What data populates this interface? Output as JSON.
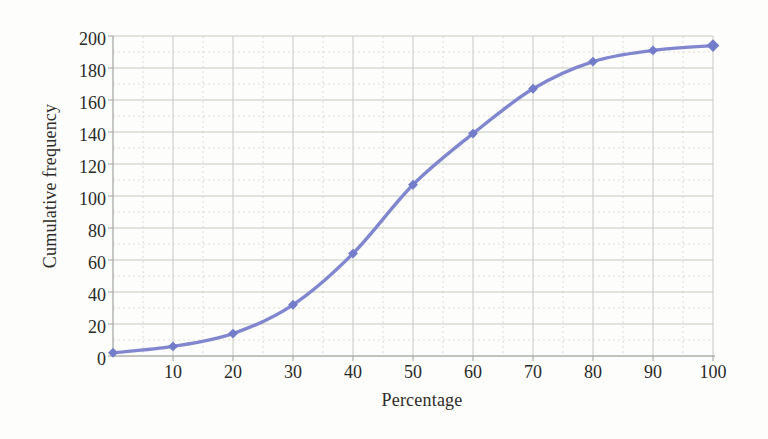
{
  "figure": {
    "background_color": "#fdfdfb"
  },
  "chart_data": {
    "type": "line",
    "title": "",
    "xlabel": "Percentage",
    "ylabel": "Cumulative frequency",
    "x": [
      0,
      10,
      20,
      30,
      40,
      50,
      60,
      70,
      80,
      90,
      100
    ],
    "y": [
      2,
      6,
      14,
      32,
      64,
      107,
      139,
      167,
      184,
      191,
      194
    ],
    "series_name": "Cumulative frequency ogive",
    "xlim": [
      0,
      100
    ],
    "ylim": [
      0,
      200
    ],
    "x_tick_labels": [
      10,
      20,
      30,
      40,
      50,
      60,
      70,
      80,
      90,
      100
    ],
    "y_tick_labels": [
      0,
      20,
      40,
      60,
      80,
      100,
      120,
      140,
      160,
      180,
      200
    ],
    "x_minor_step": 5,
    "y_minor_step": 10,
    "grid": "on",
    "legend": "none",
    "line_smoothed": true,
    "marker_shape": "diamond",
    "line_color": "#8187ce",
    "marker_color": "#737cc8",
    "grid_major_color": "#c7cac3",
    "grid_minor_color": "#dbddd6",
    "axis_color": "#adb1aa",
    "text_color": "#2e2c29"
  }
}
